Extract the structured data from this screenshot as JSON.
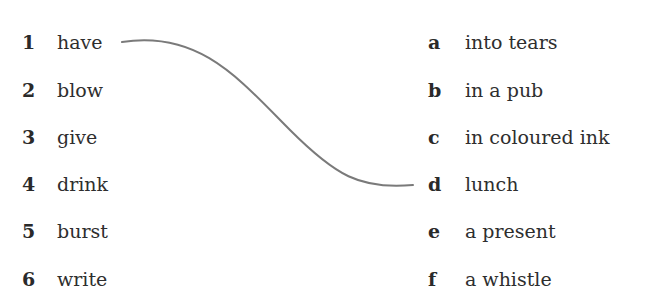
{
  "exercise": {
    "left_items": [
      {
        "number": "1",
        "word": "have"
      },
      {
        "number": "2",
        "word": "blow"
      },
      {
        "number": "3",
        "word": "give"
      },
      {
        "number": "4",
        "word": "drink"
      },
      {
        "number": "5",
        "word": "burst"
      },
      {
        "number": "6",
        "word": "write"
      }
    ],
    "right_items": [
      {
        "letter": "a",
        "phrase": "into tears"
      },
      {
        "letter": "b",
        "phrase": "in a pub"
      },
      {
        "letter": "c",
        "phrase": "in coloured ink"
      },
      {
        "letter": "d",
        "phrase": "lunch"
      },
      {
        "letter": "e",
        "phrase": "a present"
      },
      {
        "letter": "f",
        "phrase": "a whistle"
      }
    ],
    "example_match": {
      "from": "1",
      "to": "d"
    },
    "connector_color": "#7a7a7a"
  }
}
